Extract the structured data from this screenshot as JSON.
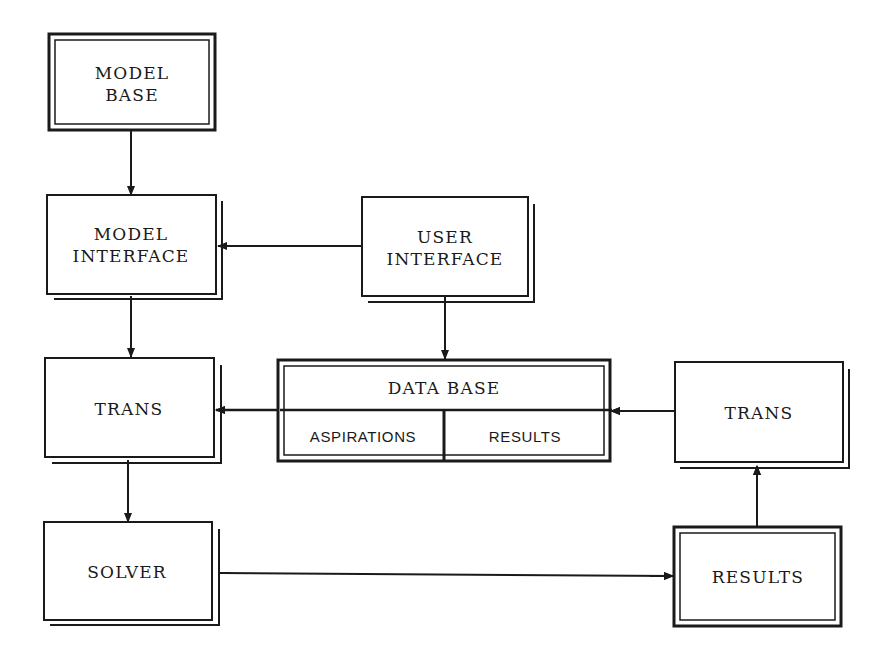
{
  "diagram": {
    "boxes": {
      "model_base": {
        "lines": [
          "MODEL",
          "BASE"
        ],
        "style": "double-border"
      },
      "model_interface": {
        "lines": [
          "MODEL",
          "INTERFACE"
        ],
        "style": "shadow"
      },
      "user_interface": {
        "lines": [
          "USER",
          "INTERFACE"
        ],
        "style": "shadow"
      },
      "trans_left": {
        "lines": [
          "TRANS"
        ],
        "style": "shadow"
      },
      "data_base": {
        "title": "DATA BASE",
        "compartments": [
          "ASPIRATIONS",
          "RESULTS"
        ],
        "style": "double-border"
      },
      "trans_right": {
        "lines": [
          "TRANS"
        ],
        "style": "shadow"
      },
      "solver": {
        "lines": [
          "SOLVER"
        ],
        "style": "shadow"
      },
      "results": {
        "lines": [
          "RESULTS"
        ],
        "style": "double-border"
      }
    },
    "connections": [
      {
        "from": "MODEL BASE",
        "to": "MODEL INTERFACE"
      },
      {
        "from": "USER INTERFACE",
        "to": "MODEL INTERFACE"
      },
      {
        "from": "USER INTERFACE",
        "to": "DATA BASE"
      },
      {
        "from": "MODEL INTERFACE",
        "to": "TRANS (left)"
      },
      {
        "from": "DATA BASE",
        "to": "TRANS (left)"
      },
      {
        "from": "TRANS (right)",
        "to": "DATA BASE"
      },
      {
        "from": "TRANS (left)",
        "to": "SOLVER"
      },
      {
        "from": "SOLVER",
        "to": "RESULTS"
      },
      {
        "from": "RESULTS",
        "to": "TRANS (right)"
      }
    ],
    "colors": {
      "ink": "#1a1a1a",
      "background": "#ffffff"
    }
  }
}
